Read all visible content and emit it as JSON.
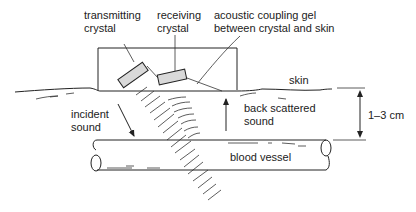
{
  "diagram": {
    "labels": {
      "transmitting_crystal": [
        "transmitting",
        "crystal"
      ],
      "receiving_crystal": [
        "receiving",
        "crystal"
      ],
      "coupling_gel": [
        "acoustic coupling gel",
        "between crystal and skin"
      ],
      "skin": "skin",
      "incident_sound": [
        "incident",
        "sound"
      ],
      "back_scattered_sound": [
        "back scattered",
        "sound"
      ],
      "blood_vessel": "blood vessel",
      "depth": "1–3 cm"
    },
    "colors": {
      "ink": "#222222",
      "crystal_fill": "#d9d9d9",
      "background": "#ffffff"
    }
  }
}
